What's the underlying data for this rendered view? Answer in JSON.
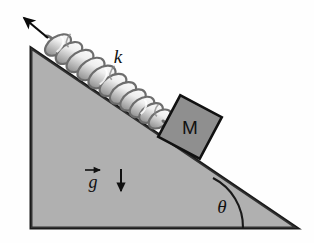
{
  "figure": {
    "type": "physics-diagram",
    "canvas": {
      "width": 314,
      "height": 243
    },
    "background_color": "#fefefe"
  },
  "incline": {
    "name": "inclined-plane-triangle",
    "fill_color": "#b2b2b2",
    "stroke_color": "#1a1a1a",
    "apex_top": {
      "x": 31,
      "y": 48
    },
    "bottom_left": {
      "x": 31,
      "y": 228
    },
    "bottom_right": {
      "x": 297,
      "y": 228
    },
    "angle_label": "θ",
    "angle_label_position": {
      "x": 222,
      "y": 212
    }
  },
  "spring": {
    "name": "coil-spring",
    "label": "k",
    "label_position": {
      "x": 118,
      "y": 63
    },
    "coil_count": 11,
    "fill_color": "#f2f2f2",
    "stroke_color": "#6b6b6b",
    "start": {
      "x": 47,
      "y": 37
    },
    "end": {
      "x": 170,
      "y": 120
    }
  },
  "block": {
    "name": "mass-block",
    "label": "M",
    "fill_color": "#8f8f8f",
    "stroke_color": "#111111",
    "center": {
      "x": 190,
      "y": 127
    },
    "size": 47,
    "rotation_deg": 28
  },
  "gravity": {
    "name": "gravity-vector-label",
    "label": "g",
    "vector_accent": "arrow-over",
    "label_position": {
      "x": 92,
      "y": 185
    },
    "arrow_start": {
      "x": 121,
      "y": 168
    },
    "arrow_end": {
      "x": 121,
      "y": 194
    },
    "color": "#111111"
  },
  "force_arrow": {
    "name": "pull-direction-arrow",
    "tail": {
      "x": 48,
      "y": 38
    },
    "head": {
      "x": 18,
      "y": 13
    },
    "color": "#0b0b0b"
  },
  "angle_arc": {
    "name": "theta-angle-arc",
    "color": "#1a1a1a",
    "radius": 55
  },
  "labels": {
    "spring_constant": "k",
    "mass": "M",
    "gravity": "g",
    "angle": "θ"
  }
}
